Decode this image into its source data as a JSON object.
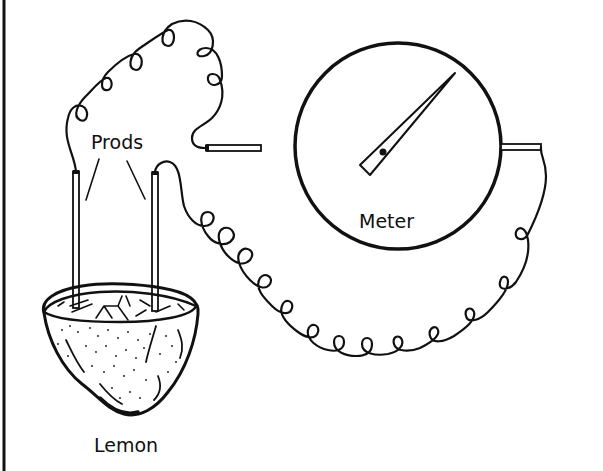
{
  "diagram": {
    "labels": {
      "prods": "Prods",
      "meter": "Meter",
      "lemon": "Lemon"
    },
    "components": [
      {
        "id": "lemon",
        "label": "Lemon",
        "type": "fruit-cell"
      },
      {
        "id": "prod-left",
        "label": "Prods",
        "type": "electrode"
      },
      {
        "id": "prod-right",
        "label": "Prods",
        "type": "electrode"
      },
      {
        "id": "meter",
        "label": "Meter",
        "type": "analog-meter"
      },
      {
        "id": "wire-top",
        "type": "coiled-wire",
        "connects": [
          "prod-left",
          "meter-left-terminal"
        ]
      },
      {
        "id": "wire-bottom",
        "type": "coiled-wire",
        "connects": [
          "prod-right",
          "meter-right-terminal"
        ]
      }
    ],
    "meter_needle": {
      "direction": "up-right",
      "deflected": true
    },
    "colors": {
      "ink": "#111111",
      "background": "#ffffff"
    }
  }
}
